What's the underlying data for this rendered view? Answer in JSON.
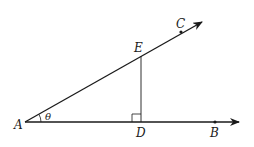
{
  "diagram": {
    "type": "geometry",
    "points": {
      "A": {
        "label": "A",
        "x": 25,
        "y": 122
      },
      "B": {
        "label": "B",
        "x": 215,
        "y": 122
      },
      "C": {
        "label": "C",
        "x": 181,
        "y": 32
      },
      "D": {
        "label": "D",
        "x": 141,
        "y": 122
      },
      "E": {
        "label": "E",
        "x": 141,
        "y": 56
      }
    },
    "angle_label": "θ",
    "right_angle_at": "D",
    "segments": [
      "AB (ray)",
      "AC (ray)",
      "ED (perpendicular)"
    ]
  }
}
